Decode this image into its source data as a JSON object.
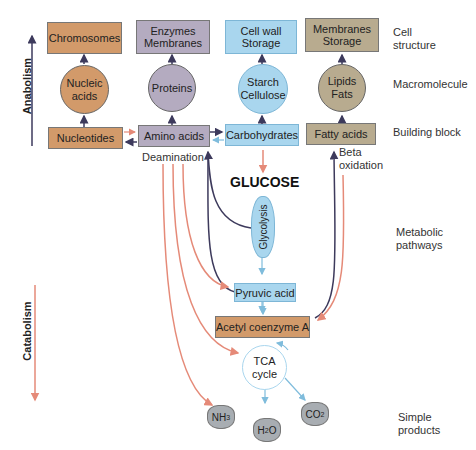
{
  "axis": {
    "anabolism": "Anabolism",
    "catabolism": "Catabolism"
  },
  "levels": {
    "cell_structure": "Cell structure",
    "macromolecule": "Macromolecule",
    "building_block": "Building block",
    "metabolic_pathways": "Metabolic pathways",
    "simple_products": "Simple products"
  },
  "cell_structures": [
    {
      "label": "Chromosomes",
      "color": "#d29a6a"
    },
    {
      "label": "Enzymes Membranes",
      "color": "#b4abc0"
    },
    {
      "label": "Cell wall Storage",
      "color": "#a9d6ee"
    },
    {
      "label": "Membranes Storage",
      "color": "#b8ab8f"
    }
  ],
  "macromolecules": [
    {
      "label": "Nucleic acids"
    },
    {
      "label": "Proteins"
    },
    {
      "label": "Starch Cellulose"
    },
    {
      "label": "Lipids Fats"
    }
  ],
  "building_blocks": [
    {
      "label": "Nucleotides"
    },
    {
      "label": "Amino acids"
    },
    {
      "label": "Carbohydrates"
    },
    {
      "label": "Fatty acids"
    }
  ],
  "pathway": {
    "deamination": "Deamination",
    "beta_oxidation": "Beta oxidation",
    "glucose": "GLUCOSE",
    "glycolysis": "Glycolysis",
    "pyruvic_acid": "Pyruvic acid",
    "acetyl_coa": "Acetyl coenzyme A",
    "tca": "TCA cycle"
  },
  "products": {
    "nh3": "NH3",
    "h2o": "H2O",
    "co2": "CO2"
  },
  "colors": {
    "anabolic_arrow": "#3d3a5c",
    "catabolic_arrow": "#e58a78",
    "blue_arrow": "#7fbcdc"
  }
}
